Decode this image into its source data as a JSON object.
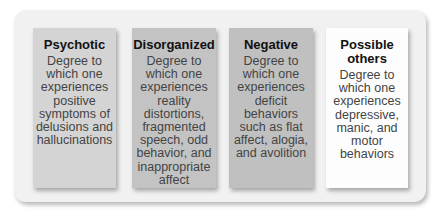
{
  "diagram": {
    "boxes": [
      {
        "title": "Psychotic",
        "description": "Degree to which one experiences positive symptoms of delusions and hallucinations",
        "color": "#d4d4d4"
      },
      {
        "title": "Disorganized",
        "description": "Degree to which one experiences reality distortions, fragmented speech, odd behavior, and inappropriate affect",
        "color": "#c3c3c3"
      },
      {
        "title": "Negative",
        "description": "Degree to which one experiences deficit behaviors such as flat affect, alogia, and avolition",
        "color": "#c0c0c0"
      },
      {
        "title": "Possible others",
        "description": "Degree to which one experiences depressive, manic, and motor behaviors",
        "color": "#fdfdfd"
      }
    ]
  }
}
